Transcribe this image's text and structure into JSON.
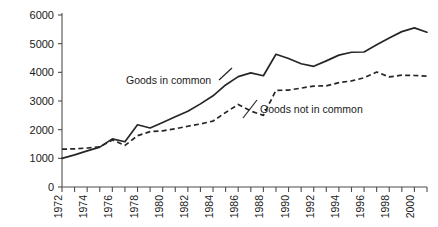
{
  "chart_data": {
    "type": "line",
    "title": "",
    "xlabel": "",
    "ylabel": "",
    "ylim": [
      0,
      6000
    ],
    "xlim": [
      1972,
      2001
    ],
    "grid": false,
    "legend_position": "inline-annotations",
    "ytick_labels": [
      "0",
      "1000",
      "2000",
      "3000",
      "4000",
      "5000",
      "6000"
    ],
    "ytick_values": [
      0,
      1000,
      2000,
      3000,
      4000,
      5000,
      6000
    ],
    "xtick_labels": [
      "1972",
      "1974",
      "1976",
      "1978",
      "1980",
      "1982",
      "1984",
      "1986",
      "1988",
      "1990",
      "1992",
      "1994",
      "1996",
      "1998",
      "2000"
    ],
    "xtick_values": [
      1972,
      1974,
      1976,
      1978,
      1980,
      1982,
      1984,
      1986,
      1988,
      1990,
      1992,
      1994,
      1996,
      1998,
      2000
    ],
    "x": [
      1972,
      1973,
      1974,
      1975,
      1976,
      1977,
      1978,
      1979,
      1980,
      1981,
      1982,
      1983,
      1984,
      1985,
      1986,
      1987,
      1988,
      1989,
      1990,
      1991,
      1992,
      1993,
      1994,
      1995,
      1996,
      1997,
      1998,
      1999,
      2000,
      2001
    ],
    "series": [
      {
        "name": "Goods in common",
        "style": "solid",
        "values": [
          1000,
          1120,
          1260,
          1390,
          1680,
          1580,
          2170,
          2060,
          2250,
          2450,
          2640,
          2900,
          3180,
          3560,
          3850,
          3980,
          3880,
          4630,
          4480,
          4300,
          4210,
          4400,
          4600,
          4700,
          4710,
          4960,
          5200,
          5420,
          5550,
          5400
        ]
      },
      {
        "name": "Goods not in common",
        "style": "dashed",
        "values": [
          1320,
          1330,
          1360,
          1400,
          1640,
          1450,
          1790,
          1930,
          1960,
          2030,
          2120,
          2200,
          2300,
          2600,
          2880,
          2650,
          2500,
          3370,
          3380,
          3450,
          3520,
          3530,
          3640,
          3700,
          3810,
          4010,
          3840,
          3900,
          3890,
          3870
        ]
      }
    ],
    "annotations": [
      {
        "text": "Goods in common",
        "x_value": 1980.2,
        "y_value": 3780
      },
      {
        "text": "Goods not in common",
        "x_value": 1989.8,
        "y_value": 2930
      }
    ]
  }
}
